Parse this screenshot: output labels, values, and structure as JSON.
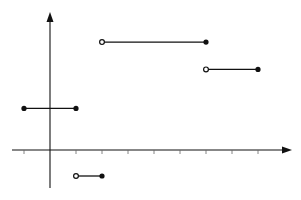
{
  "chart_data": {
    "type": "line",
    "title": "",
    "subtitle": "",
    "xlabel": "",
    "ylabel": "",
    "grid": false,
    "legend": null,
    "x_ticks": [
      -1,
      1,
      2,
      3,
      4,
      5,
      6,
      7,
      8
    ],
    "x_tick_labels": [],
    "y_ticks": [],
    "xlim": [
      -1.5,
      9.3
    ],
    "ylim": [
      -1.5,
      5.2
    ],
    "axis_color": "#111111",
    "segment_color": "#111111",
    "series": [
      {
        "name": "segment-1",
        "x": [
          -1,
          1
        ],
        "y": [
          1.6,
          1.6
        ],
        "left_endpoint": "closed",
        "right_endpoint": "closed"
      },
      {
        "name": "segment-2",
        "x": [
          1,
          2
        ],
        "y": [
          -1,
          -1
        ],
        "left_endpoint": "open",
        "right_endpoint": "closed"
      },
      {
        "name": "segment-3",
        "x": [
          2,
          6
        ],
        "y": [
          4.15,
          4.15
        ],
        "left_endpoint": "open",
        "right_endpoint": "closed"
      },
      {
        "name": "segment-4",
        "x": [
          6,
          8
        ],
        "y": [
          3.1,
          3.1
        ],
        "left_endpoint": "open",
        "right_endpoint": "closed"
      }
    ]
  },
  "layout": {
    "origin_px": [
      50,
      150
    ],
    "unit_px": 26,
    "x_axis_px": [
      12,
      292
    ],
    "y_axis_px": [
      188,
      12
    ]
  }
}
